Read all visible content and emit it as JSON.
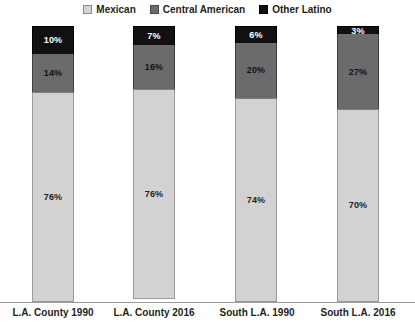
{
  "chart_data": {
    "type": "bar",
    "subtype": "stacked-bar-100",
    "title": "",
    "xlabel": "",
    "ylabel": "",
    "ylim": [
      0,
      100
    ],
    "grid": false,
    "legend_position": "top-center",
    "categories": [
      "L.A. County 1990",
      "L.A. County 2016",
      "South L.A. 1990",
      "South L.A. 2016"
    ],
    "series": [
      {
        "name": "Mexican",
        "color": "#d2d2d2",
        "values": [
          76,
          76,
          74,
          70
        ],
        "labels": [
          "76%",
          "76%",
          "74%",
          "70%"
        ]
      },
      {
        "name": "Central American",
        "color": "#6b6b6b",
        "values": [
          14,
          16,
          20,
          27
        ],
        "labels": [
          "14%",
          "16%",
          "20%",
          "27%"
        ]
      },
      {
        "name": "Other Latino",
        "color": "#111111",
        "values": [
          10,
          7,
          6,
          3
        ],
        "labels": [
          "10%",
          "7%",
          "6%",
          "3%"
        ]
      }
    ],
    "stack_order_top_to_bottom": [
      "Other Latino",
      "Central American",
      "Mexican"
    ]
  },
  "legend": {
    "items": [
      {
        "label": "Mexican",
        "swatch": "mexican-swatch-icon",
        "color": "#d2d2d2"
      },
      {
        "label": "Central American",
        "swatch": "central-american-swatch-icon",
        "color": "#6b6b6b"
      },
      {
        "label": "Other Latino",
        "swatch": "other-latino-swatch-icon",
        "color": "#111111"
      }
    ]
  },
  "axis": {
    "line_color": "#9b9b9b"
  }
}
